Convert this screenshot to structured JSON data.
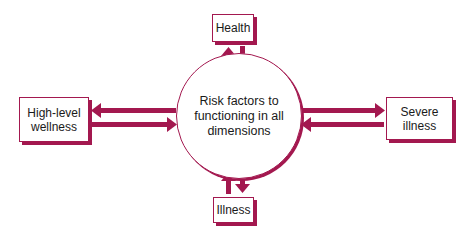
{
  "diagram": {
    "center": {
      "label": "Risk factors to functioning in all dimensions"
    },
    "top": {
      "label": "Health"
    },
    "bottom": {
      "label": "Illness"
    },
    "left": {
      "label_line1": "High-level",
      "label_line2": "wellness"
    },
    "right": {
      "label_line1": "Severe",
      "label_line2": "illness"
    },
    "arrows": [
      {
        "from": "center",
        "to": "top",
        "direction": "up"
      },
      {
        "from": "top",
        "to": "center",
        "direction": "down"
      },
      {
        "from": "center",
        "to": "bottom",
        "direction": "down"
      },
      {
        "from": "bottom",
        "to": "center",
        "direction": "up"
      },
      {
        "from": "center",
        "to": "left",
        "direction": "left"
      },
      {
        "from": "left",
        "to": "center",
        "direction": "right"
      },
      {
        "from": "center",
        "to": "right",
        "direction": "right"
      },
      {
        "from": "right",
        "to": "center",
        "direction": "left"
      }
    ],
    "colors": {
      "accent": "#a3184f",
      "background": "#ffffff",
      "text": "#1a1a1a"
    }
  }
}
